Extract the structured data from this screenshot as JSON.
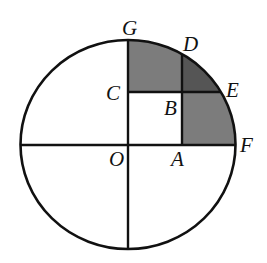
{
  "figure": {
    "title": "",
    "colors": {
      "background": "#ffffff",
      "stroke": "#111111",
      "region_medium": "#7c7c7c",
      "region_dark": "#555555"
    },
    "circle": {
      "cx": 128,
      "cy": 145,
      "rx": 107.5,
      "ry": 104.5
    },
    "points": {
      "O": {
        "label": "O",
        "x": 128,
        "y": 145
      },
      "A": {
        "label": "A",
        "x": 182,
        "y": 145
      },
      "B": {
        "label": "B",
        "x": 182,
        "y": 92
      },
      "C": {
        "label": "C",
        "x": 128,
        "y": 92
      },
      "D": {
        "label": "D",
        "x": 182,
        "y": 55
      },
      "E": {
        "label": "E",
        "x": 221,
        "y": 92
      },
      "F": {
        "label": "F",
        "x": 236,
        "y": 145
      },
      "G": {
        "label": "G",
        "x": 128,
        "y": 40
      }
    },
    "regions": [
      {
        "name": "region-CGDB",
        "shade": "medium",
        "vertices": [
          "C",
          "G",
          "D",
          "B"
        ]
      },
      {
        "name": "region-BDE",
        "shade": "dark",
        "vertices": [
          "B",
          "D",
          "E"
        ]
      },
      {
        "name": "region-ABEF",
        "shade": "medium",
        "vertices": [
          "A",
          "B",
          "E",
          "F"
        ]
      }
    ],
    "segments": [
      [
        "G",
        "O"
      ],
      [
        "O",
        "F"
      ],
      [
        "C",
        "E"
      ],
      [
        "A",
        "D"
      ]
    ]
  }
}
